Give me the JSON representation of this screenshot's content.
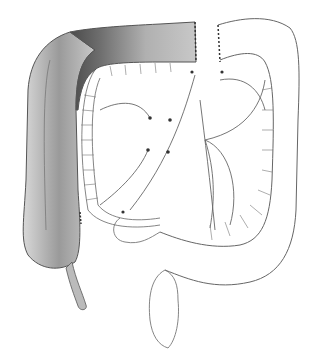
{
  "figure": {
    "width": 318,
    "height": 358,
    "colors": {
      "background": "#ffffff",
      "line": "#555555",
      "shade_dark": "#5a5a5a",
      "shade_mid": "#a8a8a8",
      "shade_light": "#dcdcdc"
    }
  }
}
